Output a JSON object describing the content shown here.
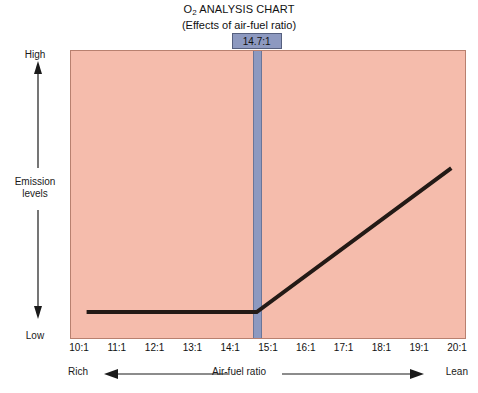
{
  "title": {
    "main_prefix": "O",
    "main_subscript": "2",
    "main_suffix": " ANALYSIS CHART",
    "subtitle": "(Effects of air-fuel ratio)"
  },
  "badge": {
    "label": "14.7:1"
  },
  "yaxis": {
    "top_label": "High",
    "bottom_label": "Low",
    "title_line1": "Emission",
    "title_line2": "levels"
  },
  "xaxis": {
    "title": "Air-fuel ratio",
    "left_label": "Rich",
    "right_label": "Lean"
  },
  "colors": {
    "plot_fill": "#f5bcac",
    "plot_border": "#b8806f",
    "stoich_band": "#8d99c0",
    "stoich_band_edge": "#6a7598",
    "curve": "#231a16",
    "text": "#1a1a1a"
  },
  "chart_data": {
    "type": "line",
    "title": "O2 ANALYSIS CHART",
    "subtitle": "(Effects of air-fuel ratio)",
    "xlabel": "Air-fuel ratio",
    "ylabel": "Emission levels",
    "grid": false,
    "legend": null,
    "xlim": [
      10,
      20
    ],
    "ylim": [
      "Low",
      "High"
    ],
    "tick_labels": [
      "10:1",
      "11:1",
      "12:1",
      "13:1",
      "14:1",
      "15:1",
      "16:1",
      "17:1",
      "18:1",
      "19:1",
      "20:1"
    ],
    "tick_values": [
      10,
      11,
      12,
      13,
      14,
      15,
      16,
      17,
      18,
      19,
      20
    ],
    "ytick_labels": [
      "Low",
      "High"
    ],
    "annotations": [
      {
        "label": "14.7:1",
        "x": 14.7,
        "type": "vertical-band",
        "note": "stoichiometric ratio"
      }
    ],
    "direction_markers": [
      {
        "label": "Rich",
        "side": "left",
        "arrow": "left"
      },
      {
        "label": "Lean",
        "side": "right",
        "arrow": "right"
      }
    ],
    "series": [
      {
        "name": "O2 emission level",
        "x": [
          10.2,
          14.7,
          19.85
        ],
        "y": [
          0.07,
          0.07,
          0.63
        ],
        "y_units": "normalized 0=Low 1=High",
        "shape": "flat then rising linear past stoichiometric point"
      }
    ]
  }
}
